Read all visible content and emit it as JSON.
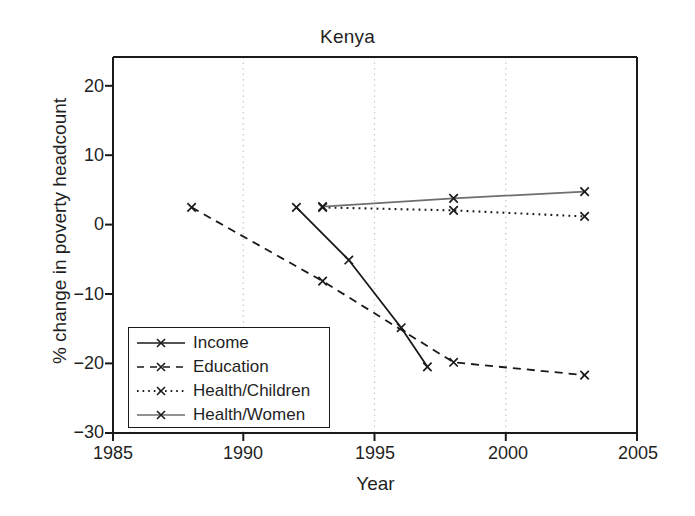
{
  "chart_data": {
    "type": "line",
    "title": "Kenya",
    "xlabel": "Year",
    "ylabel": "% change in poverty headcount",
    "xlim": [
      1985,
      2005
    ],
    "ylim": [
      -30,
      20
    ],
    "xticks": [
      1985,
      1990,
      1995,
      2000,
      2005
    ],
    "yticks": [
      20,
      10,
      0,
      -10,
      -20,
      -30
    ],
    "grid": "vertical dotted gridlines at 1990, 1995, 2000",
    "legend_position": "lower left inside axes",
    "series": [
      {
        "name": "Income",
        "style": "solid",
        "color": "#1a1a1a",
        "marker": "x",
        "x": [
          1992,
          1994,
          1996,
          1997
        ],
        "y": [
          0.0,
          -7.0,
          -16.0,
          -21.2
        ]
      },
      {
        "name": "Education",
        "style": "dashed",
        "color": "#1a1a1a",
        "marker": "x",
        "x": [
          1988,
          1993,
          1998,
          2003
        ],
        "y": [
          0.0,
          -9.8,
          -20.6,
          -22.3
        ]
      },
      {
        "name": "Health/Children",
        "style": "dotted",
        "color": "#1a1a1a",
        "marker": "x",
        "x": [
          1993,
          1998,
          2003
        ],
        "y": [
          0.0,
          -0.4,
          -1.2
        ]
      },
      {
        "name": "Health/Women",
        "style": "solid",
        "color": "#6e6e6e",
        "marker": "x",
        "x": [
          1993,
          1998,
          2003
        ],
        "y": [
          0.1,
          1.2,
          2.1
        ]
      }
    ]
  },
  "axes": {
    "y_tick_labels": [
      "20",
      "10",
      "0",
      "−10",
      "−20",
      "−30"
    ],
    "x_tick_labels": [
      "1985",
      "1990",
      "1995",
      "2000",
      "2005"
    ]
  },
  "legend": {
    "items": [
      {
        "label": "Income"
      },
      {
        "label": "Education"
      },
      {
        "label": "Health/Children"
      },
      {
        "label": "Health/Women"
      }
    ]
  },
  "colors": {
    "axis": "#1a1a1a",
    "grid": "#c9c9c9",
    "dark_series": "#1a1a1a",
    "gray_series": "#6e6e6e",
    "background": "#ffffff"
  }
}
